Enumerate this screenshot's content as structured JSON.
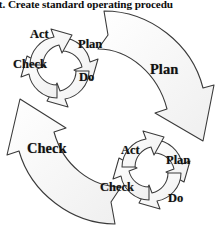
{
  "title": {
    "text": "ct. Create standard operating procedu"
  },
  "diagram": {
    "name": "nested-pdca-cycle-diagram",
    "type": "cycle",
    "colors": {
      "outline": "#3a3a3a",
      "fill": "#fafafa",
      "fill_shade": "#f2f2f2",
      "text": "#111111",
      "background": "#ffffff"
    },
    "outer_cycle": {
      "label": "outer-pdca-cycle",
      "steps": [
        {
          "key": "plan",
          "label": "Plan",
          "x": 150,
          "y": 61
        },
        {
          "key": "check",
          "label": "Check",
          "x": 27,
          "y": 140
        }
      ]
    },
    "inner_cycles": [
      {
        "label": "top-left-pdca-cycle",
        "steps": [
          {
            "key": "act",
            "label": "Act",
            "x": 30,
            "y": 27
          },
          {
            "key": "plan",
            "label": "Plan",
            "x": 78,
            "y": 37
          },
          {
            "key": "check",
            "label": "Check",
            "x": 13,
            "y": 57
          },
          {
            "key": "do",
            "label": "Do",
            "x": 79,
            "y": 70
          }
        ]
      },
      {
        "label": "bottom-right-pdca-cycle",
        "steps": [
          {
            "key": "act",
            "label": "Act",
            "x": 121,
            "y": 143
          },
          {
            "key": "plan",
            "label": "Plan",
            "x": 166,
            "y": 153
          },
          {
            "key": "check",
            "label": "Check",
            "x": 100,
            "y": 180
          },
          {
            "key": "do",
            "label": "Do",
            "x": 168,
            "y": 191
          }
        ]
      }
    ]
  }
}
